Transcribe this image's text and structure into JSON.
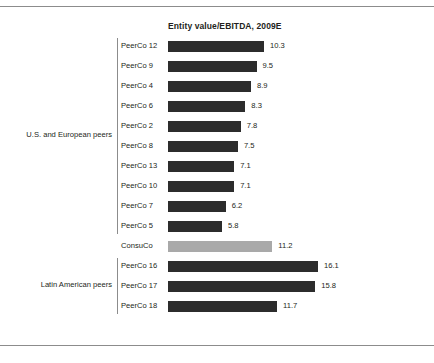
{
  "chart_data": {
    "type": "bar",
    "orientation": "horizontal",
    "title": "Entity value/EBITDA, 2009E",
    "xlabel": "",
    "ylabel": "",
    "xlim": [
      0,
      16.1
    ],
    "grid": false,
    "legend": "none",
    "categories": [
      "PeerCo 12",
      "PeerCo 9",
      "PeerCo 4",
      "PeerCo 6",
      "PeerCo 2",
      "PeerCo 8",
      "PeerCo 13",
      "PeerCo 10",
      "PeerCo 7",
      "PeerCo 5",
      "ConsuCo",
      "PeerCo 16",
      "PeerCo 17",
      "PeerCo 18"
    ],
    "values": [
      10.3,
      9.5,
      8.9,
      8.3,
      7.8,
      7.5,
      7.1,
      7.1,
      6.2,
      5.8,
      11.2,
      16.1,
      15.8,
      11.7
    ],
    "value_labels": [
      "10.3",
      "9.5",
      "8.9",
      "8.3",
      "7.8",
      "7.5",
      "7.1",
      "7.1",
      "6.2",
      "5.8",
      "11.2",
      "16.1",
      "15.8",
      "11.7"
    ],
    "highlight_index": 10,
    "colors": {
      "bar": "#2c2c2c",
      "highlight_bar": "#a9a9a9",
      "text": "#231f20",
      "rule": "#8c8c8c",
      "background": "#ffffff"
    },
    "groups": [
      {
        "label": "U.S. and European peers",
        "start_index": 0,
        "end_index": 9
      },
      {
        "label": "Latin American peers",
        "start_index": 11,
        "end_index": 13
      }
    ]
  }
}
